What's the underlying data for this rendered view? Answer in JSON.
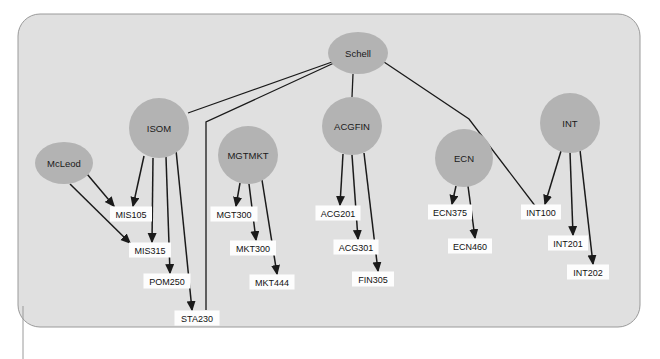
{
  "canvas": {
    "width": 660,
    "height": 359,
    "background": "#ffffff"
  },
  "container": {
    "name": "diagram-panel",
    "fill": "#e0e0e0",
    "border_color": "#9a9a9a",
    "x": 18,
    "y": 14,
    "width": 622,
    "height": 313,
    "corner_radius": 22
  },
  "colors": {
    "node_fill": "#b3b3b3",
    "box_fill": "#fdfdfd",
    "edge": "#1a1a1a",
    "text": "#111111",
    "panel": "#e0e0e0",
    "panel_border": "#9a9a9a"
  },
  "chart_data": {
    "type": "diagram",
    "title": "",
    "nodes": [
      {
        "id": "schell",
        "label": "Schell",
        "shape": "ellipse",
        "cx": 358,
        "cy": 53,
        "rx": 30,
        "ry": 21
      },
      {
        "id": "isom",
        "label": "ISOM",
        "shape": "ellipse",
        "cx": 159,
        "cy": 128,
        "rx": 30,
        "ry": 30
      },
      {
        "id": "mcleod",
        "label": "McLeod",
        "shape": "ellipse",
        "cx": 64,
        "cy": 163,
        "rx": 29,
        "ry": 21
      },
      {
        "id": "mgtmkt",
        "label": "MGTMKT",
        "shape": "ellipse",
        "cx": 248,
        "cy": 155,
        "rx": 30,
        "ry": 29
      },
      {
        "id": "acgfin",
        "label": "ACGFIN",
        "shape": "ellipse",
        "cx": 352,
        "cy": 126,
        "rx": 30,
        "ry": 29
      },
      {
        "id": "ecn",
        "label": "ECN",
        "shape": "ellipse",
        "cx": 464,
        "cy": 158,
        "rx": 29,
        "ry": 29
      },
      {
        "id": "int",
        "label": "INT",
        "shape": "ellipse",
        "cx": 570,
        "cy": 123,
        "rx": 30,
        "ry": 30
      }
    ],
    "boxes": [
      {
        "id": "mis105",
        "label": "MIS105",
        "cx": 131,
        "cy": 214,
        "w": 42,
        "h": 15
      },
      {
        "id": "mis315",
        "label": "MIS315",
        "cx": 150,
        "cy": 250,
        "w": 42,
        "h": 15
      },
      {
        "id": "pom250",
        "label": "POM250",
        "cx": 167,
        "cy": 281,
        "w": 47,
        "h": 15
      },
      {
        "id": "sta230",
        "label": "STA230",
        "cx": 197,
        "cy": 318,
        "w": 45,
        "h": 15
      },
      {
        "id": "mgt300",
        "label": "MGT300",
        "cx": 234,
        "cy": 214,
        "w": 47,
        "h": 15
      },
      {
        "id": "mkt300",
        "label": "MKT300",
        "cx": 253,
        "cy": 248,
        "w": 46,
        "h": 15
      },
      {
        "id": "mkt444",
        "label": "MKT444",
        "cx": 272,
        "cy": 282,
        "w": 45,
        "h": 15
      },
      {
        "id": "acg201",
        "label": "ACG201",
        "cx": 338,
        "cy": 213,
        "w": 45,
        "h": 15
      },
      {
        "id": "acg301",
        "label": "ACG301",
        "cx": 356,
        "cy": 247,
        "w": 45,
        "h": 15
      },
      {
        "id": "fin305",
        "label": "FIN305",
        "cx": 373,
        "cy": 279,
        "w": 42,
        "h": 15
      },
      {
        "id": "ecn375",
        "label": "ECN375",
        "cx": 450,
        "cy": 212,
        "w": 44,
        "h": 15
      },
      {
        "id": "ecn460",
        "label": "ECN460",
        "cx": 470,
        "cy": 246,
        "w": 44,
        "h": 15
      },
      {
        "id": "int100",
        "label": "INT100",
        "cx": 541,
        "cy": 212,
        "w": 40,
        "h": 15
      },
      {
        "id": "int201",
        "label": "INT201",
        "cx": 568,
        "cy": 243,
        "w": 40,
        "h": 15
      },
      {
        "id": "int202",
        "label": "INT202",
        "cx": 588,
        "cy": 272,
        "w": 42,
        "h": 15
      }
    ],
    "edges": [
      {
        "from": "schell",
        "to": "isom",
        "arrow": false,
        "points": "332,62 188,113"
      },
      {
        "from": "schell",
        "to": "acgfin",
        "arrow": false,
        "points": "353,74 352,97"
      },
      {
        "from": "schell",
        "to": "mgtmkt",
        "arrow": false,
        "points": "334,63 206,122 206,310"
      },
      {
        "from": "schell",
        "to": "int",
        "arrow": false,
        "points": "384,62 469,119 536,207"
      },
      {
        "from": "mcleod",
        "to": "mis105",
        "arrow": true,
        "points": "87,174 114,206"
      },
      {
        "from": "mcleod",
        "to": "mis315",
        "arrow": true,
        "points": "70,184 130,243"
      },
      {
        "from": "isom",
        "to": "mis105",
        "arrow": true,
        "points": "144,156 133,206"
      },
      {
        "from": "isom",
        "to": "mis315",
        "arrow": true,
        "points": "153,158 152,242"
      },
      {
        "from": "isom",
        "to": "pom250",
        "arrow": true,
        "points": "166,157 170,273"
      },
      {
        "from": "isom",
        "to": "sta230",
        "arrow": true,
        "points": "176,150 192,310"
      },
      {
        "from": "mgtmkt",
        "to": "mgt300",
        "arrow": true,
        "points": "240,183 236,206"
      },
      {
        "from": "mgtmkt",
        "to": "mkt300",
        "arrow": true,
        "points": "249,184 256,240"
      },
      {
        "from": "mgtmkt",
        "to": "mkt444",
        "arrow": true,
        "points": "262,180 277,274"
      },
      {
        "from": "acgfin",
        "to": "acg201",
        "arrow": true,
        "points": "343,154 340,205"
      },
      {
        "from": "acgfin",
        "to": "acg301",
        "arrow": true,
        "points": "352,155 358,239"
      },
      {
        "from": "acgfin",
        "to": "fin305",
        "arrow": true,
        "points": "364,153 378,271"
      },
      {
        "from": "ecn",
        "to": "ecn375",
        "arrow": true,
        "points": "456,186 452,204"
      },
      {
        "from": "ecn",
        "to": "ecn460",
        "arrow": true,
        "points": "468,186 475,238"
      },
      {
        "from": "int",
        "to": "int100",
        "arrow": true,
        "points": "561,151 545,204"
      },
      {
        "from": "int",
        "to": "int201",
        "arrow": true,
        "points": "570,152 573,235"
      },
      {
        "from": "int",
        "to": "int202",
        "arrow": true,
        "points": "580,150 593,264"
      }
    ]
  },
  "tail": {
    "name": "callout-tail",
    "points": "23,306 23,359"
  }
}
